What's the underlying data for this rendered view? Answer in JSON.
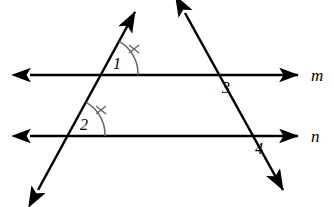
{
  "figure": {
    "type": "geometry-diagram",
    "background_color": "#ffffff",
    "stroke_color": "#000000",
    "arc_color": "#555555",
    "width": 334,
    "height": 207
  },
  "lines": [
    {
      "id": "line-m",
      "label": "m",
      "orientation": "horizontal",
      "y": 75,
      "x_start": 30,
      "x_end": 298,
      "arrows": "both",
      "label_x": 311,
      "label_y": 67
    },
    {
      "id": "line-n",
      "label": "n",
      "orientation": "horizontal",
      "y": 136,
      "x_start": 30,
      "x_end": 298,
      "arrows": "both",
      "label_x": 311,
      "label_y": 128
    }
  ],
  "transversals": [
    {
      "id": "transversal-left",
      "x1": 135,
      "y1": 12,
      "x2": 38,
      "y2": 190,
      "arrows": "both",
      "crosses_m_at_x": 101,
      "crosses_n_at_x": 68
    },
    {
      "id": "transversal-right",
      "x1": 185,
      "y1": 13,
      "x2": 283,
      "y2": 190,
      "arrows": "both",
      "crosses_m_at_x": 215,
      "crosses_n_at_x": 248
    }
  ],
  "angles": [
    {
      "id": "angle-1",
      "label": "1",
      "vertex_x": 101,
      "vertex_y": 75,
      "label_x": 113,
      "label_y": 56,
      "arc_radius": 37,
      "has_tick_mark": true,
      "tick_count": 1
    },
    {
      "id": "angle-2",
      "label": "2",
      "vertex_x": 68,
      "vertex_y": 136,
      "label_x": 80,
      "label_y": 117,
      "arc_radius": 37,
      "has_tick_mark": true,
      "tick_count": 1
    },
    {
      "id": "angle-3",
      "label": "3",
      "vertex_x": 215,
      "vertex_y": 75,
      "label_x": 222,
      "label_y": 80,
      "arc_radius": 0,
      "has_tick_mark": false,
      "tick_count": 0
    },
    {
      "id": "angle-4",
      "label": "4",
      "vertex_x": 248,
      "vertex_y": 136,
      "label_x": 255,
      "label_y": 141,
      "arc_radius": 0,
      "has_tick_mark": false,
      "tick_count": 0
    }
  ]
}
